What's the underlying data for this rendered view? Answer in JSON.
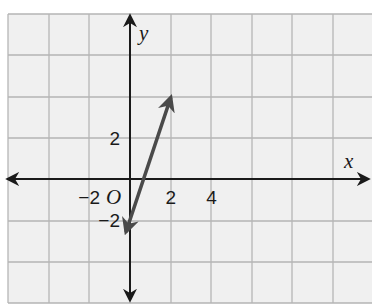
{
  "chart_data": {
    "type": "line",
    "title": "",
    "xlabel": "x",
    "ylabel": "y",
    "origin_label": "O",
    "xlim": [
      -3,
      6
    ],
    "ylim": [
      -3,
      4
    ],
    "grid": true,
    "grid_step": 1,
    "x_ticks": [
      {
        "value": -2,
        "label": "−2"
      },
      {
        "value": 2,
        "label": "2"
      },
      {
        "value": 4,
        "label": "4"
      }
    ],
    "y_ticks": [
      {
        "value": 2,
        "label": "2"
      },
      {
        "value": -2,
        "label": "−2"
      }
    ],
    "series": [
      {
        "name": "line",
        "equation": "y = 3x - 2",
        "slope": 3,
        "intercept": -2,
        "x": [
          -0.2,
          0,
          0.667,
          2
        ],
        "y": [
          -2.6,
          -2,
          0,
          4
        ],
        "arrows_both_ends": true,
        "color": "#4a4a4a"
      }
    ]
  },
  "colors": {
    "background": "#f0f0f0",
    "grid": "#b5b5b5",
    "axis": "#1a1a1a",
    "line": "#4a4a4a"
  }
}
